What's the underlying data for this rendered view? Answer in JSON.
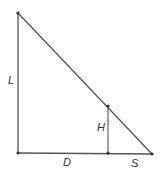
{
  "diagram": {
    "type": "similar-triangles",
    "colors": {
      "line": "#555555",
      "point": "#333333",
      "label": "#333333"
    },
    "points": {
      "top": [
        18,
        13
      ],
      "bottom_left": [
        18,
        153
      ],
      "foot": [
        108,
        153
      ],
      "mid": [
        108,
        106
      ],
      "bottom_right": [
        152,
        154
      ]
    },
    "labels": {
      "L": {
        "text": "L",
        "x": 8,
        "y": 84
      },
      "H": {
        "text": "H",
        "x": 97,
        "y": 131
      },
      "D": {
        "text": "D",
        "x": 63,
        "y": 166
      },
      "S": {
        "text": "S",
        "x": 131,
        "y": 167
      }
    }
  }
}
